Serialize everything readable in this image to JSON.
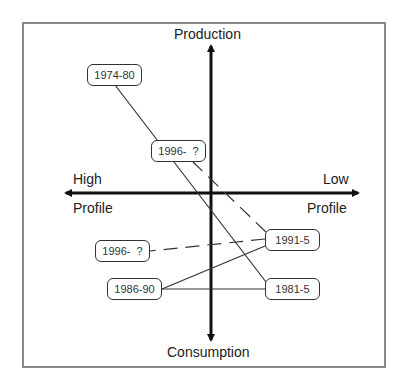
{
  "axes": {
    "top": "Production",
    "bottom": "Consumption",
    "left_top": "High",
    "left_bottom": "Profile",
    "right_top": "Low",
    "right_bottom": "Profile"
  },
  "nodes": [
    {
      "id": "n1974",
      "label": "1974-80"
    },
    {
      "id": "n1996a",
      "label": "1996-  ?"
    },
    {
      "id": "n1991",
      "label": "1991-5"
    },
    {
      "id": "n1996b",
      "label": "1996-  ?"
    },
    {
      "id": "n1986",
      "label": "1986-90"
    },
    {
      "id": "n1981",
      "label": "1981-5"
    }
  ],
  "edges": [
    {
      "from": "1974-80",
      "to": "1981-5",
      "style": "solid"
    },
    {
      "from": "1981-5",
      "to": "1986-90",
      "style": "solid"
    },
    {
      "from": "1986-90",
      "to": "1991-5",
      "style": "solid"
    },
    {
      "from": "1991-5",
      "to": "1996- ? (upper)",
      "style": "dashed"
    },
    {
      "from": "1991-5",
      "to": "1996- ? (lower)",
      "style": "dashed"
    }
  ],
  "colors": {
    "frame": "#8a8a8a",
    "axis": "#111111",
    "line": "#333333"
  }
}
